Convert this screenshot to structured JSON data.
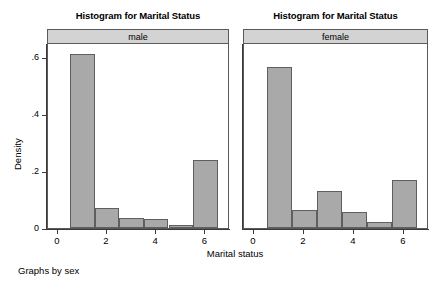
{
  "chart_data": {
    "type": "bar",
    "title": "Histogram for Marital Status",
    "xlabel": "Marital status",
    "ylabel": "Density",
    "footnote": "Graphs by sex",
    "grid": false,
    "legend": "none",
    "xlim": [
      -0.4,
      7.0
    ],
    "ylim": [
      0,
      0.65
    ],
    "xticks": [
      "0",
      "2",
      "4",
      "6"
    ],
    "xtick_values": [
      0,
      2,
      4,
      6
    ],
    "yticks": [
      "0",
      ".2",
      ".4",
      ".6"
    ],
    "ytick_values": [
      0,
      0.2,
      0.4,
      0.6
    ],
    "bin_width": 1,
    "bin_centers": [
      1,
      2,
      3,
      4,
      5,
      6
    ],
    "bin_edges": [
      0.5,
      1.5,
      2.5,
      3.5,
      4.5,
      5.5,
      6.5
    ],
    "panels": [
      {
        "name": "male",
        "title": "Histogram for Marital Status",
        "banner_label": "male",
        "values": [
          0.61,
          0.07,
          0.035,
          0.03,
          0.01,
          0.24
        ]
      },
      {
        "name": "female",
        "title": "Histogram for Marital Status",
        "banner_label": "female",
        "values": [
          0.565,
          0.065,
          0.13,
          0.055,
          0.02,
          0.17
        ]
      }
    ],
    "colors": {
      "bar_fill": "#a9a9a9",
      "bar_edge": "#5f5f5f",
      "banner_fill": "#d3d3d3",
      "frame": "#5a5a5a",
      "axis": "#3a3a3a",
      "background": "#ffffff"
    }
  }
}
